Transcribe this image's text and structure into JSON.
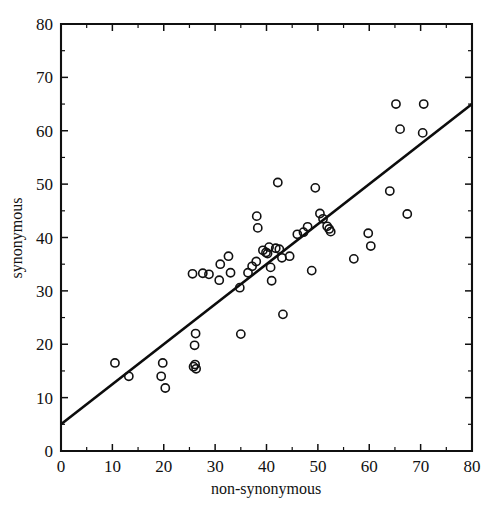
{
  "chart_data": {
    "type": "scatter",
    "title": "",
    "xlabel": "non-synonymous",
    "ylabel": "synonymous",
    "xlim": [
      0,
      80
    ],
    "ylim": [
      0,
      80
    ],
    "xticks": [
      0,
      10,
      20,
      30,
      40,
      50,
      60,
      70,
      80
    ],
    "xticklabels": [
      "0",
      "10",
      "20",
      "30",
      "40",
      "50",
      "60",
      "70",
      "80"
    ],
    "yticks": [
      0,
      10,
      20,
      30,
      40,
      50,
      60,
      70,
      80
    ],
    "yticklabels": [
      "0",
      "10",
      "20",
      "30",
      "40",
      "50",
      "60",
      "70",
      "80"
    ],
    "minor_tick_interval": 5,
    "grid": false,
    "legend": null,
    "marker": "open-circle",
    "marker_color": "#111111",
    "series": [
      {
        "name": "genes",
        "points": [
          [
            10.5,
            16.5
          ],
          [
            13.2,
            14.0
          ],
          [
            19.8,
            16.5
          ],
          [
            19.5,
            14.0
          ],
          [
            20.3,
            11.8
          ],
          [
            25.6,
            33.2
          ],
          [
            26.2,
            22.0
          ],
          [
            26.0,
            19.8
          ],
          [
            25.8,
            15.8
          ],
          [
            26.3,
            15.4
          ],
          [
            26.1,
            16.2
          ],
          [
            27.6,
            33.3
          ],
          [
            28.8,
            33.1
          ],
          [
            31.0,
            35.0
          ],
          [
            30.8,
            32.0
          ],
          [
            32.6,
            36.5
          ],
          [
            33.0,
            33.4
          ],
          [
            34.8,
            30.6
          ],
          [
            35.0,
            21.9
          ],
          [
            36.4,
            33.4
          ],
          [
            37.2,
            34.6
          ],
          [
            38.0,
            35.5
          ],
          [
            38.1,
            44.0
          ],
          [
            38.3,
            41.8
          ],
          [
            39.3,
            37.6
          ],
          [
            39.9,
            37.2
          ],
          [
            40.5,
            38.2
          ],
          [
            40.2,
            37.0
          ],
          [
            40.8,
            34.4
          ],
          [
            41.0,
            31.9
          ],
          [
            41.8,
            38.0
          ],
          [
            42.2,
            50.3
          ],
          [
            42.5,
            37.8
          ],
          [
            43.0,
            36.2
          ],
          [
            43.2,
            25.6
          ],
          [
            44.5,
            36.5
          ],
          [
            46.0,
            40.6
          ],
          [
            47.2,
            41.0
          ],
          [
            48.0,
            42.0
          ],
          [
            48.8,
            33.8
          ],
          [
            49.5,
            49.3
          ],
          [
            50.4,
            44.5
          ],
          [
            51.0,
            43.5
          ],
          [
            51.8,
            42.1
          ],
          [
            52.2,
            41.6
          ],
          [
            52.5,
            41.1
          ],
          [
            57.0,
            36.0
          ],
          [
            59.8,
            40.8
          ],
          [
            60.3,
            38.4
          ],
          [
            64.0,
            48.7
          ],
          [
            65.2,
            65.0
          ],
          [
            66.0,
            60.3
          ],
          [
            67.4,
            44.4
          ],
          [
            70.6,
            65.0
          ],
          [
            70.4,
            59.6
          ]
        ]
      }
    ],
    "fit_line": {
      "type": "linear",
      "x": [
        0,
        80
      ],
      "y": [
        5.0,
        65.0
      ],
      "slope": 0.75,
      "intercept": 5.0
    }
  },
  "axes": {
    "x_title": "non-synonymous",
    "y_title": "synonymous"
  }
}
